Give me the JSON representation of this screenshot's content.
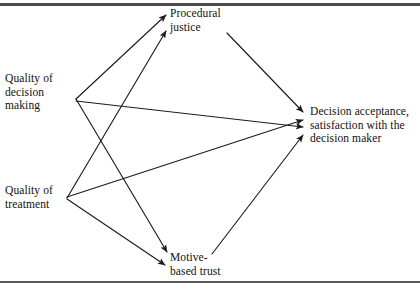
{
  "figure": {
    "type": "path-diagram",
    "nodes": [
      {
        "id": "procedural_justice",
        "label": "Procedural\njustice",
        "x": 170,
        "y": 7
      },
      {
        "id": "quality_decision",
        "label": "Quality of\ndecision\nmaking",
        "x": 5,
        "y": 72
      },
      {
        "id": "quality_treatment",
        "label": "Quality of\ntreatment",
        "x": 5,
        "y": 184
      },
      {
        "id": "motive_based_trust",
        "label": "Motive-\nbased trust",
        "x": 170,
        "y": 251
      },
      {
        "id": "decision_acceptance",
        "label": "Decision acceptance,\nsatisfaction with the\ndecision maker",
        "x": 310,
        "y": 105
      }
    ],
    "edges": [
      {
        "id": "qdm-to-pj",
        "from": "quality_decision",
        "to": "procedural_justice",
        "x1": 76,
        "y1": 99,
        "x2": 166,
        "y2": 15
      },
      {
        "id": "qdm-to-mbt",
        "from": "quality_decision",
        "to": "motive_based_trust",
        "x1": 76,
        "y1": 99,
        "x2": 167,
        "y2": 252
      },
      {
        "id": "qdm-to-da",
        "from": "quality_decision",
        "to": "decision_acceptance",
        "x1": 76,
        "y1": 101,
        "x2": 303,
        "y2": 127
      },
      {
        "id": "qt-to-pj",
        "from": "quality_treatment",
        "to": "procedural_justice",
        "x1": 67,
        "y1": 198,
        "x2": 166,
        "y2": 31
      },
      {
        "id": "qt-to-mbt",
        "from": "quality_treatment",
        "to": "motive_based_trust",
        "x1": 67,
        "y1": 199,
        "x2": 165,
        "y2": 265
      },
      {
        "id": "qt-to-da",
        "from": "quality_treatment",
        "to": "decision_acceptance",
        "x1": 67,
        "y1": 197,
        "x2": 303,
        "y2": 120
      },
      {
        "id": "pj-to-da",
        "from": "procedural_justice",
        "to": "decision_acceptance",
        "x1": 227,
        "y1": 33,
        "x2": 303,
        "y2": 112
      },
      {
        "id": "mbt-to-da",
        "from": "motive_based_trust",
        "to": "decision_acceptance",
        "x1": 212,
        "y1": 254,
        "x2": 303,
        "y2": 135
      }
    ],
    "style": {
      "line_color": "#1c1c1c",
      "text_color": "#111111",
      "background": "#ffffff",
      "rule_color": "#4a4a4a"
    }
  }
}
